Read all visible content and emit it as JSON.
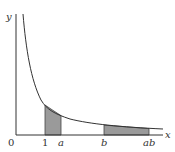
{
  "diagram": {
    "function": "y = 1/x",
    "axes": {
      "x_label": "x",
      "y_label": "y",
      "origin_label": "0"
    },
    "tick_labels": {
      "one": "1",
      "a": "a",
      "b": "b",
      "ab": "ab"
    },
    "shaded_regions": [
      {
        "name": "area-1-to-a",
        "from": "1",
        "to": "a"
      },
      {
        "name": "area-b-to-ab",
        "from": "b",
        "to": "ab"
      }
    ],
    "colors": {
      "shade": "#9a9a9a",
      "line": "#333333"
    }
  }
}
